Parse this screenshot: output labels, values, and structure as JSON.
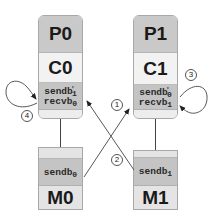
{
  "diagram": {
    "processes": [
      {
        "id": "p0",
        "label": "P0",
        "component": "C0",
        "buffers": [
          {
            "name": "sendb",
            "prime": "'",
            "sub": "1"
          },
          {
            "name": "recvb",
            "prime": "",
            "sub": "0"
          }
        ]
      },
      {
        "id": "p1",
        "label": "P1",
        "component": "C1",
        "buffers": [
          {
            "name": "sendb",
            "prime": "'",
            "sub": "0"
          },
          {
            "name": "recvb",
            "prime": "",
            "sub": "1"
          }
        ]
      }
    ],
    "memories": [
      {
        "id": "m0",
        "label": "M0",
        "buffer": {
          "name": "sendb",
          "sub": "0"
        }
      },
      {
        "id": "m1",
        "label": "M1",
        "buffer": {
          "name": "sendb",
          "sub": "1"
        }
      }
    ],
    "steps": [
      {
        "n": "1",
        "from": "M0.sendb0",
        "to": "C1.recvb1"
      },
      {
        "n": "2",
        "from": "M1.sendb1",
        "to": "C0.recvb0"
      },
      {
        "n": "3",
        "from": "C1.sendb'0",
        "to": "C1.recvb1",
        "kind": "self-loop"
      },
      {
        "n": "4",
        "from": "C0.sendb'1",
        "to": "C0.recvb0",
        "kind": "self-loop"
      }
    ],
    "colors": {
      "process_header": "#c9c9c9",
      "component": "#f2f2f2",
      "buffer": "#c4c4c4",
      "edge": "#444444"
    }
  }
}
